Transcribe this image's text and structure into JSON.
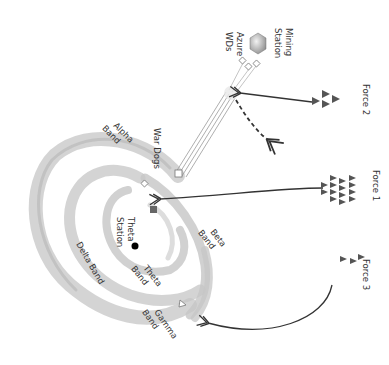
{
  "diagram": {
    "stations": {
      "mining": {
        "label_line1": "Mining",
        "label_line2": "Station"
      },
      "theta": {
        "label_line1": "Theta",
        "label_line2": "Station"
      }
    },
    "units": {
      "azure": {
        "label_line1": "Azure",
        "label_line2": "WDs"
      },
      "war_dogs": {
        "label": "War Dogs"
      }
    },
    "bands": {
      "alpha": {
        "label_line1": "Alpha",
        "label_line2": "Band"
      },
      "beta": {
        "label_line1": "Beta",
        "label_line2": "Band"
      },
      "delta": {
        "label": "Delta Band"
      },
      "theta": {
        "label_line1": "Theta",
        "label_line2": "Band"
      },
      "gamma": {
        "label_line1": "Gamma",
        "label_line2": "Band"
      }
    },
    "forces": [
      {
        "label": "Force 2",
        "count": 4
      },
      {
        "label": "Force 1",
        "count": 14
      },
      {
        "label": "Force 3",
        "count": 3
      }
    ],
    "colors": {
      "band": "#c8c8c8",
      "arrow": "#333333",
      "triangle": "#555555",
      "hexagon": "#9a9a9a",
      "enemy_square": "#666666",
      "station_dot": "#000000"
    }
  }
}
